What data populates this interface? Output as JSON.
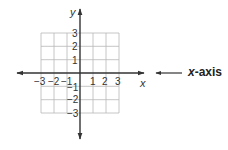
{
  "diagram": {
    "colors": {
      "axis": "#333333",
      "grid": "#b8b8b8",
      "text": "#333333"
    },
    "axes": {
      "x_label": "x",
      "y_label": "y"
    },
    "x_ticks": [
      {
        "label": "−3",
        "value": -3
      },
      {
        "label": "−2",
        "value": -2
      },
      {
        "label": "−1",
        "value": -1
      },
      {
        "label": "1",
        "value": 1
      },
      {
        "label": "2",
        "value": 2
      },
      {
        "label": "3",
        "value": 3
      }
    ],
    "y_ticks": [
      {
        "label": "3",
        "value": 3
      },
      {
        "label": "2",
        "value": 2
      },
      {
        "label": "1",
        "value": 1
      },
      {
        "label": "−1",
        "value": -1
      },
      {
        "label": "−2",
        "value": -2
      },
      {
        "label": "−3",
        "value": -3
      }
    ],
    "grid": {
      "x_min": -3,
      "x_max": 3,
      "y_min": -3,
      "y_max": 3
    },
    "callout": {
      "var": "x",
      "suffix": "-axis",
      "text": "x-axis"
    }
  }
}
